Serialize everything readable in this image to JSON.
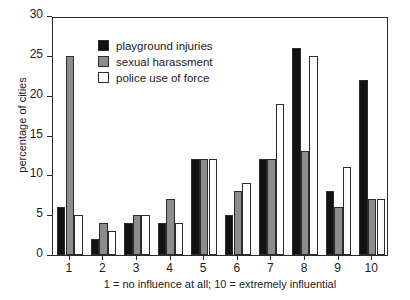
{
  "chart_data": {
    "type": "bar",
    "title": "",
    "xlabel": "1 = no influence at all; 10 = extremely influential",
    "ylabel": "percentage of cities",
    "categories": [
      "1",
      "2",
      "3",
      "4",
      "5",
      "6",
      "7",
      "8",
      "9",
      "10"
    ],
    "series": [
      {
        "name": "playground injuries",
        "color": "#121212",
        "values": [
          6,
          2,
          4,
          4,
          12,
          5,
          12,
          26,
          8,
          22
        ]
      },
      {
        "name": "sexual harassment",
        "color": "#8c8c8c",
        "values": [
          25,
          4,
          5,
          7,
          12,
          8,
          12,
          13,
          6,
          7
        ]
      },
      {
        "name": "police use of force",
        "color": "#ffffff",
        "values": [
          5,
          3,
          5,
          4,
          12,
          9,
          19,
          25,
          11,
          7
        ]
      }
    ],
    "ylim": [
      0,
      30
    ],
    "yticks": [
      0,
      5,
      10,
      15,
      20,
      25,
      30
    ],
    "ytick_labels": [
      "0",
      "5",
      "10",
      "15",
      "20",
      "25",
      "30"
    ],
    "grid": false,
    "legend_position": "top-left-inside"
  }
}
